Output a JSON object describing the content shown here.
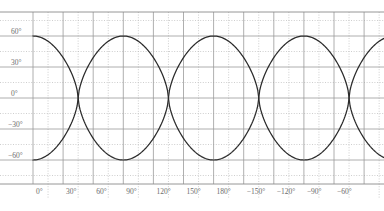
{
  "chart_data": {
    "type": "line",
    "title": "",
    "subtitle": "",
    "xlabel": "",
    "ylabel": "",
    "grid": true,
    "legend": "none",
    "xlim": [
      0,
      360
    ],
    "ylim": [
      -75,
      82
    ],
    "x_tick_labels": [
      "0°",
      "30°",
      "60°",
      "90°",
      "120°",
      "150°",
      "180°",
      "−150°",
      "−120°",
      "−90°",
      "−60°"
    ],
    "x_tick_values": [
      0,
      30,
      60,
      90,
      120,
      150,
      180,
      210,
      240,
      270,
      300
    ],
    "y_tick_labels": [
      "60°",
      "30°",
      "0°",
      "−30°",
      "−60°"
    ],
    "y_tick_values": [
      60,
      30,
      0,
      -30,
      -60
    ],
    "x_minor_step": 15,
    "y_minor_step": 15,
    "series": [
      {
        "name": "curve-a",
        "color": "#2b2b2b",
        "amplitude": 60,
        "period": 180,
        "phase_deg": 0,
        "shape": "flattened-cosine",
        "points_x": [
          0,
          10,
          20,
          30,
          40,
          50,
          60,
          70,
          80,
          90,
          100,
          110,
          120,
          130,
          140,
          150,
          160,
          170,
          180,
          190,
          200,
          210,
          220,
          230,
          240,
          250,
          260,
          270,
          280,
          290,
          300,
          310,
          320,
          330,
          340,
          350,
          360
        ],
        "points_y": [
          57,
          59.5,
          60,
          59.5,
          57,
          50,
          36,
          14,
          -14,
          -36,
          -50,
          -57,
          -59.5,
          -60,
          -59.5,
          -57,
          -50,
          -36,
          -14,
          14,
          36,
          50,
          57,
          59.5,
          60,
          59.5,
          57,
          50,
          36,
          14,
          -14,
          -36,
          -50,
          -57,
          -59.5,
          -60,
          -59.5
        ]
      },
      {
        "name": "curve-b",
        "color": "#2b2b2b",
        "amplitude": 60,
        "period": 180,
        "phase_deg": 90,
        "shape": "flattened-cosine",
        "points_x": [
          0,
          10,
          20,
          30,
          40,
          50,
          60,
          70,
          80,
          90,
          100,
          110,
          120,
          130,
          140,
          150,
          160,
          170,
          180,
          190,
          200,
          210,
          220,
          230,
          240,
          250,
          260,
          270,
          280,
          290,
          300,
          310,
          320,
          330,
          340,
          350,
          360
        ],
        "points_y": [
          -59.5,
          -60,
          -59.5,
          -57,
          -50,
          -36,
          -14,
          14,
          36,
          50,
          57,
          59.5,
          60,
          59.5,
          57,
          50,
          36,
          14,
          -14,
          -36,
          -50,
          -57,
          -59.5,
          -60,
          -59.5,
          -57,
          -50,
          -36,
          -14,
          14,
          36,
          50,
          57,
          59.5,
          60,
          59.5,
          57
        ]
      }
    ],
    "colors": {
      "curve": "#2b2b2b",
      "major_grid": "#9a9a9a",
      "minor_grid": "#b9b9b9",
      "axis": "#8a8a8a",
      "tick_text": "#6b6b6b",
      "background": "#ffffff"
    }
  }
}
